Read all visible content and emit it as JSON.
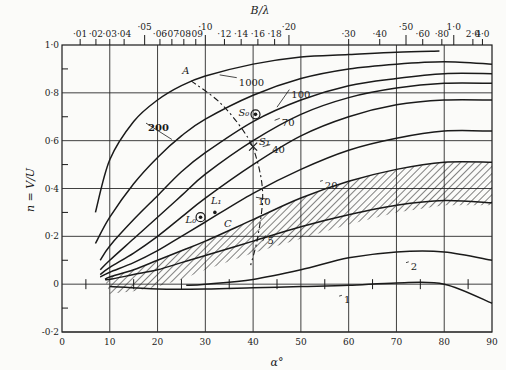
{
  "chart_data": {
    "type": "line",
    "title": "",
    "xlabel": "α°",
    "ylabel": "n = V/U",
    "top_axis_label": "B/λ",
    "xlim": [
      0,
      90
    ],
    "ylim": [
      -0.2,
      1.0
    ],
    "grid": true,
    "x_ticks": [
      "0",
      "10",
      "20",
      "30",
      "40",
      "50",
      "60",
      "70",
      "80",
      "90"
    ],
    "y_ticks": [
      "-0·2",
      "0",
      "0·2",
      "0·4",
      "0·6",
      "0·8",
      "1·0"
    ],
    "top_ticks": [
      {
        "label": "·01",
        "alpha": 3.8
      },
      {
        "label": "·02",
        "alpha": 7.1
      },
      {
        "label": "·03",
        "alpha": 10.0
      },
      {
        "label": "·04",
        "alpha": 13.0
      },
      {
        "label": "·05",
        "alpha": 17.3
      },
      {
        "label": "·06",
        "alpha": 20.5
      },
      {
        "label": "·07",
        "alpha": 23.0
      },
      {
        "label": "·08",
        "alpha": 25.5
      },
      {
        "label": "·09",
        "alpha": 28.0
      },
      {
        "label": "·10",
        "alpha": 30.0
      },
      {
        "label": "·12",
        "alpha": 34.0
      },
      {
        "label": "·14",
        "alpha": 37.5
      },
      {
        "label": "·16",
        "alpha": 41.0
      },
      {
        "label": "·18",
        "alpha": 44.5
      },
      {
        "label": "·20",
        "alpha": 47.5
      },
      {
        "label": "·30",
        "alpha": 60.0
      },
      {
        "label": "·40",
        "alpha": 66.5
      },
      {
        "label": "·50",
        "alpha": 72.0
      },
      {
        "label": "·60",
        "alpha": 75.5
      },
      {
        "label": "·80",
        "alpha": 79.5
      },
      {
        "label": "1·0",
        "alpha": 82.0
      },
      {
        "label": "2·0",
        "alpha": 86.0
      },
      {
        "label": "4·0",
        "alpha": 88.0
      }
    ],
    "series": [
      {
        "name": "1000",
        "x": [
          7,
          10,
          15,
          20,
          25,
          30,
          40,
          50,
          60,
          70,
          79
        ],
        "values": [
          0.3,
          0.52,
          0.68,
          0.77,
          0.83,
          0.87,
          0.92,
          0.95,
          0.96,
          0.97,
          0.975
        ]
      },
      {
        "name": "200",
        "x": [
          7,
          10,
          15,
          20,
          25,
          30,
          40,
          50,
          60,
          70,
          80,
          90
        ],
        "values": [
          0.17,
          0.28,
          0.42,
          0.53,
          0.62,
          0.69,
          0.79,
          0.86,
          0.9,
          0.92,
          0.93,
          0.92
        ]
      },
      {
        "name": "100",
        "x": [
          8,
          10,
          15,
          20,
          25,
          30,
          40,
          50,
          60,
          70,
          80,
          90
        ],
        "values": [
          0.1,
          0.16,
          0.27,
          0.37,
          0.47,
          0.55,
          0.68,
          0.77,
          0.83,
          0.86,
          0.88,
          0.88
        ]
      },
      {
        "name": "70",
        "x": [
          8,
          10,
          15,
          20,
          25,
          30,
          40,
          50,
          60,
          70,
          80,
          90
        ],
        "values": [
          0.06,
          0.1,
          0.19,
          0.28,
          0.37,
          0.46,
          0.6,
          0.71,
          0.78,
          0.82,
          0.84,
          0.84
        ]
      },
      {
        "name": "40",
        "x": [
          8,
          10,
          15,
          20,
          25,
          30,
          40,
          50,
          60,
          70,
          80,
          90
        ],
        "values": [
          0.04,
          0.07,
          0.13,
          0.2,
          0.28,
          0.36,
          0.5,
          0.62,
          0.7,
          0.75,
          0.77,
          0.77
        ]
      },
      {
        "name": "20",
        "x": [
          8,
          10,
          15,
          20,
          25,
          30,
          40,
          50,
          60,
          70,
          80,
          90
        ],
        "values": [
          0.03,
          0.05,
          0.09,
          0.14,
          0.2,
          0.26,
          0.38,
          0.48,
          0.56,
          0.61,
          0.64,
          0.64
        ]
      },
      {
        "name": "10",
        "x": [
          9,
          10,
          15,
          20,
          25,
          30,
          40,
          50,
          60,
          70,
          80,
          90
        ],
        "values": [
          0.02,
          0.03,
          0.06,
          0.1,
          0.14,
          0.18,
          0.27,
          0.36,
          0.43,
          0.48,
          0.51,
          0.51
        ]
      },
      {
        "name": "5",
        "x": [
          9,
          10,
          15,
          20,
          25,
          30,
          40,
          50,
          60,
          70,
          80,
          90
        ],
        "values": [
          0.02,
          0.02,
          0.04,
          0.06,
          0.09,
          0.12,
          0.18,
          0.24,
          0.29,
          0.33,
          0.35,
          0.34
        ]
      },
      {
        "name": "2",
        "x": [
          26,
          30,
          40,
          50,
          60,
          70,
          80,
          90
        ],
        "values": [
          -0.005,
          0.0,
          0.02,
          0.06,
          0.11,
          0.135,
          0.135,
          0.1
        ]
      },
      {
        "name": "1",
        "x": [
          10,
          20,
          30,
          40,
          50,
          60,
          70,
          80,
          90
        ],
        "values": [
          -0.01,
          -0.02,
          -0.02,
          -0.015,
          -0.01,
          -0.005,
          0.005,
          0.0,
          -0.08
        ]
      }
    ],
    "shaded_region": {
      "description": "hatched band between curve 10 and curve 5 (and below curve 5 near α=10-30)",
      "x_range": [
        10,
        90
      ]
    },
    "dashed_curve": {
      "name": "A",
      "x": [
        27,
        33,
        38,
        40.5,
        42,
        41,
        39.5
      ],
      "values": [
        0.85,
        0.76,
        0.64,
        0.54,
        0.38,
        0.2,
        0.08
      ]
    },
    "annotations": [
      {
        "text": "A",
        "x": 26,
        "y": 0.88
      },
      {
        "text": "S₀",
        "x": 40.5,
        "y": 0.71,
        "marker": "circled-dot"
      },
      {
        "text": "S₁",
        "x": 40,
        "y": 0.575,
        "marker": "cross"
      },
      {
        "text": "L₀",
        "x": 29,
        "y": 0.28,
        "marker": "circled-dot"
      },
      {
        "text": "L₁",
        "x": 32,
        "y": 0.3,
        "marker": "dot"
      },
      {
        "text": "C",
        "x": 33.5,
        "y": 0.255
      }
    ],
    "curve_labels": [
      "1000",
      "200",
      "100",
      "70",
      "40",
      "20",
      "10",
      "5",
      "2",
      "1"
    ]
  }
}
